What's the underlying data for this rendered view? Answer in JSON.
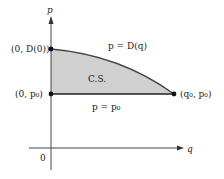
{
  "diagram": {
    "type": "consumer-surplus",
    "axes": {
      "x_label": "q",
      "y_label": "p",
      "origin_label": "0"
    },
    "points": {
      "demand_intercept": "(0, D(0))",
      "price_point": "(0, p₀)",
      "equilibrium": "(q₀, p₀)"
    },
    "curves": {
      "demand": "p = D(q)",
      "price_line": "p = p₀"
    },
    "region_label": "C.S.",
    "colors": {
      "fill": "#d0d0d0",
      "line": "#333333",
      "axis": "#444444"
    }
  }
}
